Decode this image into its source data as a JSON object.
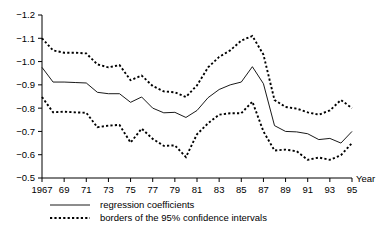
{
  "chart_data": {
    "type": "line",
    "title": "",
    "xlabel": "Year",
    "ylabel": "",
    "xlim": [
      1967,
      1995
    ],
    "ylim": [
      -1.2,
      -0.5
    ],
    "y_axis_inverted": true,
    "grid": false,
    "legend_position": "bottom",
    "x": [
      1967,
      1968,
      1969,
      1970,
      1971,
      1972,
      1973,
      1974,
      1975,
      1976,
      1977,
      1978,
      1979,
      1980,
      1981,
      1982,
      1983,
      1984,
      1985,
      1986,
      1987,
      1988,
      1989,
      1990,
      1991,
      1992,
      1993,
      1994,
      1995
    ],
    "xtick_labels": [
      "1967",
      "69",
      "71",
      "73",
      "75",
      "77",
      "79",
      "81",
      "83",
      "85",
      "87",
      "89",
      "91",
      "93",
      "95"
    ],
    "xtick_values": [
      1967,
      1969,
      1971,
      1973,
      1975,
      1977,
      1979,
      1981,
      1983,
      1985,
      1987,
      1989,
      1991,
      1993,
      1995
    ],
    "ytick_labels": [
      "-1.2",
      "-1.1",
      "-1.0",
      "-0.9",
      "-0.8",
      "-0.7",
      "-0.6",
      "-0.5"
    ],
    "ytick_values": [
      -1.2,
      -1.1,
      -1.0,
      -0.9,
      -0.8,
      -0.7,
      -0.6,
      -0.5
    ],
    "series": [
      {
        "name": "regression coefficients",
        "style": "solid",
        "values": [
          -0.975,
          -0.912,
          -0.912,
          -0.91,
          -0.908,
          -0.868,
          -0.862,
          -0.862,
          -0.825,
          -0.848,
          -0.8,
          -0.78,
          -0.782,
          -0.76,
          -0.79,
          -0.845,
          -0.88,
          -0.9,
          -0.912,
          -0.978,
          -0.905,
          -0.725,
          -0.7,
          -0.698,
          -0.69,
          -0.665,
          -0.67,
          -0.65,
          -0.7
        ]
      },
      {
        "name": "upper border of the 95% confidence interval",
        "style": "dotted",
        "values": [
          -1.1,
          -1.048,
          -1.038,
          -1.038,
          -1.035,
          -0.988,
          -0.975,
          -0.985,
          -0.92,
          -0.94,
          -0.895,
          -0.872,
          -0.868,
          -0.848,
          -0.898,
          -0.975,
          -1.02,
          -1.048,
          -1.09,
          -1.11,
          -1.03,
          -0.835,
          -0.805,
          -0.798,
          -0.782,
          -0.772,
          -0.79,
          -0.835,
          -0.8
        ]
      },
      {
        "name": "lower border of the 95% confidence interval",
        "style": "dotted",
        "values": [
          -0.848,
          -0.782,
          -0.785,
          -0.782,
          -0.78,
          -0.718,
          -0.725,
          -0.728,
          -0.652,
          -0.712,
          -0.668,
          -0.638,
          -0.64,
          -0.59,
          -0.688,
          -0.735,
          -0.772,
          -0.778,
          -0.778,
          -0.828,
          -0.7,
          -0.618,
          -0.622,
          -0.615,
          -0.578,
          -0.588,
          -0.578,
          -0.598,
          -0.65
        ]
      }
    ],
    "legend": [
      {
        "label": "regression coefficients",
        "style": "solid"
      },
      {
        "label": "borders of the 95% confidence intervals",
        "style": "dotted"
      }
    ]
  }
}
